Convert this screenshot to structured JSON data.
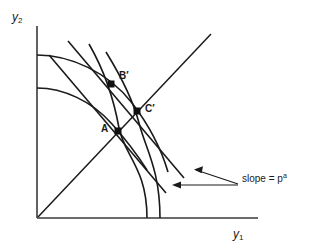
{
  "figure": {
    "background": "#ffffff",
    "stroke_color": "#1a1a1a",
    "axes": {
      "y_axis_label": "y",
      "y_axis_subscript": "2",
      "x_axis_label": "y",
      "x_axis_subscript": "1",
      "origin": [
        37,
        218
      ],
      "x_axis_end": [
        258,
        218
      ],
      "y_axis_top": [
        37,
        26
      ]
    },
    "points": [
      {
        "id": "A",
        "label": "A",
        "x": 118,
        "y": 131,
        "marker": "filled-square"
      },
      {
        "id": "Bp",
        "label": "B′",
        "x": 111,
        "y": 84,
        "marker": "filled-square"
      },
      {
        "id": "Cp",
        "label": "C′",
        "x": 137,
        "y": 111,
        "marker": "filled-square"
      }
    ],
    "annotation": {
      "text_prefix": "slope = p",
      "text_superscript": "a",
      "full_text": "slope = pᵃ",
      "arrow_count": 2
    },
    "curves": [
      {
        "name": "outer-transformation-curve",
        "kind": "concave"
      },
      {
        "name": "inner-indifference-curve",
        "kind": "concave"
      },
      {
        "name": "steep-curve-left",
        "kind": "convex"
      },
      {
        "name": "steep-curve-right",
        "kind": "convex"
      },
      {
        "name": "price-line-through-A",
        "kind": "straight",
        "slope_label": "pᵃ"
      },
      {
        "name": "price-line-through-Bprime",
        "kind": "straight",
        "slope_label": "pᵃ"
      },
      {
        "name": "forty-five-degree-ray",
        "kind": "straight"
      }
    ]
  }
}
